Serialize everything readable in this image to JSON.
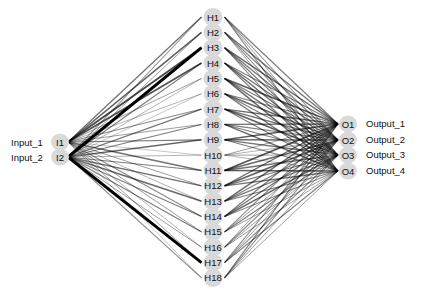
{
  "diagram": {
    "type": "neural-network",
    "node_fill": "#d9d9d9",
    "edge_color": "#000000",
    "layers": [
      {
        "name": "input",
        "nodes": [
          "I1",
          "I2"
        ],
        "labels": [
          "Input_1",
          "Input_2"
        ]
      },
      {
        "name": "hidden",
        "nodes": [
          "H1",
          "H2",
          "H3",
          "H4",
          "H5",
          "H6",
          "H7",
          "H8",
          "H9",
          "H10",
          "H11",
          "H12",
          "H13",
          "H14",
          "H15",
          "H16",
          "H17",
          "H18"
        ]
      },
      {
        "name": "output",
        "nodes": [
          "O1",
          "O2",
          "O3",
          "O4"
        ],
        "labels": [
          "Output_1",
          "Output_2",
          "Output_3",
          "Output_4"
        ]
      }
    ],
    "input_hidden_weights": [
      [
        0.35,
        0.45,
        0.55,
        0.5,
        0.2,
        0.15,
        0.25,
        0.2,
        0.3,
        0.1,
        0.35,
        0.2,
        0.15,
        0.25,
        0.2,
        0.15,
        0.2,
        0.1
      ],
      [
        0.25,
        0.2,
        1.0,
        0.3,
        0.15,
        0.1,
        0.35,
        0.3,
        0.4,
        0.15,
        0.3,
        0.35,
        0.4,
        0.3,
        0.3,
        0.2,
        0.95,
        0.25
      ]
    ],
    "hidden_output_weights": [
      [
        0.3,
        0.25,
        0.2,
        0.3
      ],
      [
        0.35,
        0.3,
        0.25,
        0.2
      ],
      [
        0.4,
        0.35,
        0.3,
        0.25
      ],
      [
        0.3,
        0.35,
        0.4,
        0.3
      ],
      [
        0.45,
        0.3,
        0.35,
        0.4
      ],
      [
        0.3,
        0.4,
        0.3,
        0.35
      ],
      [
        0.4,
        0.35,
        0.45,
        0.3
      ],
      [
        0.35,
        0.3,
        0.3,
        0.4
      ],
      [
        0.45,
        0.4,
        0.35,
        0.3
      ],
      [
        0.2,
        0.15,
        0.2,
        0.15
      ],
      [
        0.5,
        0.4,
        0.35,
        0.45
      ],
      [
        0.35,
        0.45,
        0.3,
        0.35
      ],
      [
        0.4,
        0.3,
        0.35,
        0.3
      ],
      [
        0.3,
        0.35,
        0.4,
        0.25
      ],
      [
        0.25,
        0.2,
        0.3,
        0.2
      ],
      [
        0.2,
        0.25,
        0.2,
        0.2
      ],
      [
        0.25,
        0.2,
        0.25,
        0.3
      ],
      [
        0.3,
        0.25,
        0.2,
        0.2
      ]
    ]
  }
}
